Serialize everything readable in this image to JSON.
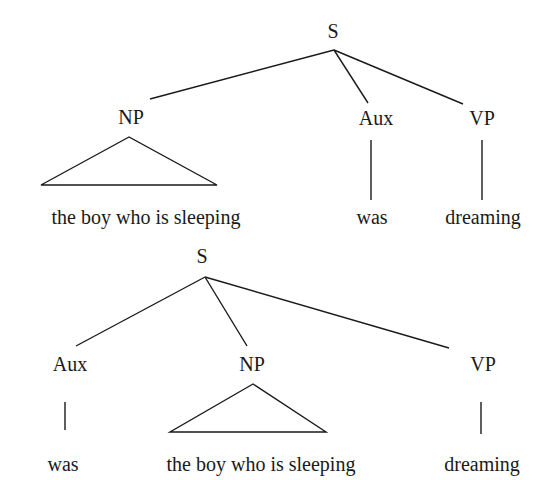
{
  "tree1": {
    "root": "S",
    "nodes": {
      "np": "NP",
      "aux": "Aux",
      "vp": "VP"
    },
    "leaves": {
      "np": "the boy who is sleeping",
      "aux": "was",
      "vp": "dreaming"
    }
  },
  "tree2": {
    "root": "S",
    "nodes": {
      "aux": "Aux",
      "np": "NP",
      "vp": "VP"
    },
    "leaves": {
      "aux": "was",
      "np": "the boy who is sleeping",
      "vp": "dreaming"
    }
  },
  "colors": {
    "ink": "#1a1a1a",
    "background": "#ffffff"
  }
}
